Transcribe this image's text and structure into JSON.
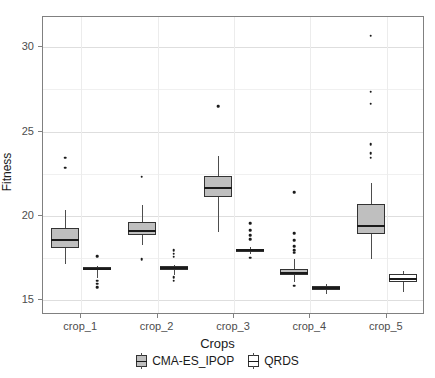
{
  "chart_data": {
    "type": "box",
    "title": "",
    "xlabel": "Crops",
    "ylabel": "Fitness",
    "categories": [
      "crop_1",
      "crop_2",
      "crop_3",
      "crop_4",
      "crop_5"
    ],
    "ylim": [
      14.1,
      31.8
    ],
    "yticks": [
      15,
      20,
      25,
      30
    ],
    "ytick_labels": [
      "15",
      "20",
      "25",
      "30"
    ],
    "grid": "horizontal-and-vertical-light",
    "legend": {
      "position": "bottom",
      "entries": [
        {
          "label": "CMA-ES_IPOP",
          "fill": "#bfbfbf"
        },
        {
          "label": "QRDS",
          "fill": "#ffffff"
        }
      ]
    },
    "series": [
      {
        "name": "CMA-ES_IPOP",
        "fill": "#bfbfbf",
        "boxes": [
          {
            "category": "crop_1",
            "min": 17.15,
            "q1": 18.05,
            "median": 18.55,
            "q3": 19.25,
            "max": 20.35,
            "outliers": [
              23.45,
              22.85
            ]
          },
          {
            "category": "crop_2",
            "min": 18.25,
            "q1": 18.85,
            "median": 19.1,
            "q3": 19.6,
            "max": 20.65,
            "outliers": [
              22.3,
              17.4
            ]
          },
          {
            "category": "crop_3",
            "min": 19.05,
            "q1": 21.1,
            "median": 21.65,
            "q3": 22.35,
            "max": 23.55,
            "outliers": [
              26.5
            ]
          },
          {
            "category": "crop_4",
            "min": 16.05,
            "q1": 16.45,
            "median": 16.6,
            "q3": 16.85,
            "max": 17.45,
            "outliers": [
              21.4,
              18.95,
              18.55,
              18.2,
              17.95,
              17.8,
              15.85
            ]
          },
          {
            "category": "crop_5",
            "min": 17.4,
            "q1": 18.9,
            "median": 19.4,
            "q3": 20.7,
            "max": 21.95,
            "outliers": [
              30.7,
              27.35,
              26.65,
              24.25,
              23.7,
              23.45
            ]
          }
        ]
      },
      {
        "name": "QRDS",
        "fill": "#ffffff",
        "boxes": [
          {
            "category": "crop_1",
            "min": 16.3,
            "q1": 16.75,
            "median": 16.85,
            "q3": 16.95,
            "max": 17.0,
            "outliers": [
              17.6,
              16.15,
              15.95,
              15.75
            ]
          },
          {
            "category": "crop_2",
            "min": 16.5,
            "q1": 16.8,
            "median": 16.9,
            "q3": 17.0,
            "max": 17.1,
            "outliers": [
              17.95,
              17.75,
              17.55,
              16.35,
              16.15
            ]
          },
          {
            "category": "crop_3",
            "min": 17.7,
            "q1": 17.85,
            "median": 17.95,
            "q3": 18.05,
            "max": 18.15,
            "outliers": [
              19.55,
              19.15,
              18.85,
              18.6,
              17.5
            ]
          },
          {
            "category": "crop_4",
            "min": 15.35,
            "q1": 15.6,
            "median": 15.7,
            "q3": 15.85,
            "max": 15.95,
            "outliers": []
          },
          {
            "category": "crop_5",
            "min": 15.45,
            "q1": 16.05,
            "median": 16.25,
            "q3": 16.55,
            "max": 16.7,
            "outliers": []
          }
        ]
      }
    ]
  }
}
